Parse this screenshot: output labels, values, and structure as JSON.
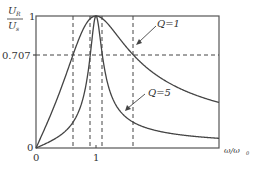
{
  "chart_data": {
    "type": "line",
    "title": "",
    "xlabel": "ω/ω₀",
    "ylabel": "U_R / U_s",
    "xlim": [
      0,
      3.05
    ],
    "ylim": [
      0,
      1
    ],
    "x_ticks": [
      {
        "value": 0,
        "label": "0"
      },
      {
        "value": 1,
        "label": "1"
      }
    ],
    "y_ticks": [
      {
        "value": 0,
        "label": "0"
      },
      {
        "value": 0.707,
        "label": "0.707"
      },
      {
        "value": 1,
        "label": "1"
      }
    ],
    "grid": false,
    "reference_lines": {
      "horizontal": [
        0.707
      ],
      "vertical": [
        0.618,
        0.905,
        1.105,
        1.618
      ]
    },
    "series": [
      {
        "name": "Q=1",
        "Q": 1,
        "x": [
          0,
          0.25,
          0.5,
          0.618,
          0.75,
          1.0,
          1.25,
          1.5,
          1.618,
          2.0,
          2.5,
          3.0
        ],
        "values": [
          0,
          0.26,
          0.55,
          0.707,
          0.87,
          1.0,
          0.91,
          0.77,
          0.707,
          0.55,
          0.43,
          0.35
        ]
      },
      {
        "name": "Q=5",
        "Q": 5,
        "x": [
          0,
          0.25,
          0.5,
          0.75,
          0.905,
          1.0,
          1.105,
          1.25,
          1.5,
          2.0,
          2.5,
          3.0
        ],
        "values": [
          0,
          0.05,
          0.13,
          0.34,
          0.707,
          1.0,
          0.707,
          0.41,
          0.24,
          0.13,
          0.09,
          0.07
        ]
      }
    ],
    "annotations": [
      {
        "text": "Q=1",
        "points_to": "Q=1 curve"
      },
      {
        "text": "Q=5",
        "points_to": "Q=5 curve"
      }
    ]
  },
  "labels": {
    "y_num": "U",
    "y_num_sub": "R",
    "y_den": "U",
    "y_den_sub": "s",
    "y_top": "1",
    "y_707": "0.707",
    "y_zero": "0",
    "x_zero": "0",
    "x_one": "1",
    "x_axis_a": "ω/ω",
    "x_axis_sub": "0",
    "q1": "Q=1",
    "q5": "Q=5"
  },
  "colors": {
    "axis": "#555555",
    "curve": "#444444",
    "dash": "#444444"
  }
}
